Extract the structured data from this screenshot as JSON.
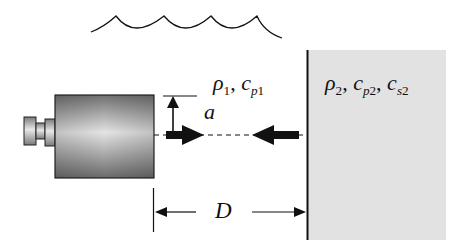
{
  "diagram": {
    "labels": {
      "fluid_density": "ρ",
      "fluid_density_sub": "1",
      "fluid_sep": ", ",
      "fluid_speed": "c",
      "fluid_speed_sub_p": "p",
      "fluid_speed_sub_n": "1",
      "solid_density": "ρ",
      "solid_density_sub": "2",
      "solid_sep1": ", ",
      "solid_p_speed": "c",
      "solid_p_speed_sub_p": "p",
      "solid_p_speed_sub_n": "2",
      "solid_sep2": ", ",
      "solid_s_speed": "c",
      "solid_s_speed_sub_s": "s",
      "solid_s_speed_sub_n": "2",
      "radius": "a",
      "distance": "D"
    },
    "elements": {
      "water_surface": "wavy free-surface line",
      "transducer": "cylindrical transducer with connector",
      "solid": "solid half-space (gray)",
      "incident_arrow": "outgoing wave arrow",
      "reflected_arrow": "reflected wave arrow",
      "radius_arrow": "radius dimension arrow",
      "distance_arrows": "distance dimension arrows"
    },
    "colors": {
      "solid_fill": "#e2e2e2",
      "transducer_dark": "#6f6f6f",
      "transducer_light": "#e6e6e6",
      "ink": "#111111"
    }
  }
}
